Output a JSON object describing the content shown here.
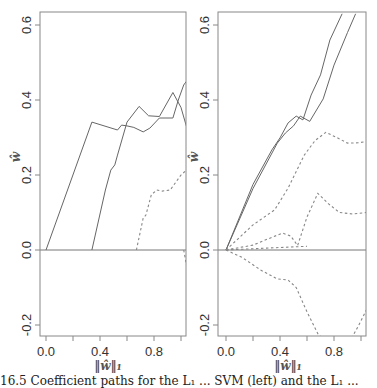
{
  "chart_data": [
    {
      "type": "line",
      "title": "",
      "xlabel": "||ŵ||₁",
      "ylabel": "ŵ",
      "xlim": [
        -0.04,
        1.04
      ],
      "ylim": [
        -0.23,
        0.63
      ],
      "xticks": [
        "0.0",
        "0.4",
        "0.8"
      ],
      "xtick_values": [
        0.0,
        0.2,
        0.4,
        0.6,
        0.8,
        1.0
      ],
      "yticks": [
        "-0.2",
        "0.0",
        "0.2",
        "0.4",
        "0.6"
      ],
      "ytick_values": [
        -0.2,
        0.0,
        0.2,
        0.4,
        0.6
      ],
      "zero_line": true,
      "grid": false,
      "series": [
        {
          "name": "coef-1",
          "style": "solid",
          "points": [
            [
              0.0,
              0.0
            ],
            [
              0.34,
              0.341
            ],
            [
              0.53,
              0.32
            ],
            [
              0.56,
              0.333
            ],
            [
              0.6,
              0.331
            ],
            [
              0.65,
              0.327
            ],
            [
              0.72,
              0.315
            ],
            [
              0.77,
              0.325
            ],
            [
              0.84,
              0.352
            ],
            [
              0.94,
              0.352
            ],
            [
              0.98,
              0.4
            ],
            [
              1.02,
              0.44
            ],
            [
              1.04,
              0.45
            ]
          ]
        },
        {
          "name": "coef-2",
          "style": "solid",
          "points": [
            [
              0.34,
              0.0
            ],
            [
              0.44,
              0.16
            ],
            [
              0.48,
              0.213
            ],
            [
              0.51,
              0.227
            ],
            [
              0.53,
              0.253
            ],
            [
              0.6,
              0.341
            ],
            [
              0.69,
              0.383
            ],
            [
              0.76,
              0.358
            ],
            [
              0.84,
              0.356
            ],
            [
              0.94,
              0.42
            ],
            [
              1.0,
              0.38
            ],
            [
              1.04,
              0.33
            ]
          ]
        },
        {
          "name": "coef-3",
          "style": "dashed",
          "points": [
            [
              0.67,
              0.0
            ],
            [
              0.72,
              0.085
            ],
            [
              0.74,
              0.093
            ],
            [
              0.78,
              0.147
            ],
            [
              0.82,
              0.16
            ],
            [
              0.86,
              0.157
            ],
            [
              0.92,
              0.16
            ],
            [
              0.96,
              0.18
            ],
            [
              1.0,
              0.2
            ],
            [
              1.04,
              0.213
            ]
          ]
        },
        {
          "name": "coef-4",
          "style": "dashed",
          "points": [
            [
              1.02,
              0.0
            ],
            [
              1.03,
              -0.02
            ],
            [
              1.04,
              -0.04
            ]
          ]
        }
      ]
    },
    {
      "type": "line",
      "title": "",
      "xlabel": "||ŵ||₁",
      "ylabel": "ŵ",
      "xlim": [
        -0.06,
        1.04
      ],
      "ylim": [
        -0.23,
        0.63
      ],
      "xticks": [
        "0.0",
        "0.4",
        "0.8"
      ],
      "xtick_values": [
        0.0,
        0.2,
        0.4,
        0.6,
        0.8,
        1.0
      ],
      "yticks": [
        "-0.2",
        "0.0",
        "0.2",
        "0.4",
        "0.6"
      ],
      "ytick_values": [
        -0.2,
        0.0,
        0.2,
        0.4,
        0.6
      ],
      "zero_line": true,
      "grid": false,
      "series": [
        {
          "name": "coef-1",
          "style": "solid",
          "points": [
            [
              0.0,
              0.0
            ],
            [
              0.2,
              0.175
            ],
            [
              0.34,
              0.267
            ],
            [
              0.4,
              0.299
            ],
            [
              0.46,
              0.339
            ],
            [
              0.52,
              0.357
            ],
            [
              0.57,
              0.347
            ],
            [
              0.63,
              0.413
            ],
            [
              0.7,
              0.467
            ],
            [
              0.77,
              0.56
            ],
            [
              0.86,
              0.63
            ]
          ]
        },
        {
          "name": "coef-2",
          "style": "solid",
          "points": [
            [
              0.0,
              0.0
            ],
            [
              0.2,
              0.164
            ],
            [
              0.38,
              0.285
            ],
            [
              0.44,
              0.312
            ],
            [
              0.5,
              0.331
            ],
            [
              0.55,
              0.357
            ],
            [
              0.62,
              0.343
            ],
            [
              0.72,
              0.403
            ],
            [
              0.8,
              0.493
            ],
            [
              0.9,
              0.58
            ],
            [
              0.96,
              0.63
            ]
          ]
        },
        {
          "name": "coef-3",
          "style": "dashed",
          "points": [
            [
              0.0,
              0.0
            ],
            [
              0.2,
              0.067
            ],
            [
              0.36,
              0.107
            ],
            [
              0.46,
              0.165
            ],
            [
              0.58,
              0.253
            ],
            [
              0.66,
              0.292
            ],
            [
              0.74,
              0.314
            ],
            [
              0.82,
              0.3
            ],
            [
              0.9,
              0.285
            ],
            [
              0.98,
              0.286
            ],
            [
              1.04,
              0.289
            ]
          ]
        },
        {
          "name": "coef-4",
          "style": "dashed",
          "points": [
            [
              0.0,
              0.0
            ],
            [
              0.2,
              0.013
            ],
            [
              0.34,
              0.034
            ],
            [
              0.42,
              0.045
            ],
            [
              0.48,
              0.037
            ],
            [
              0.53,
              0.012
            ],
            [
              0.6,
              0.088
            ],
            [
              0.68,
              0.151
            ],
            [
              0.76,
              0.123
            ],
            [
              0.84,
              0.1
            ],
            [
              0.94,
              0.096
            ],
            [
              1.04,
              0.1
            ]
          ]
        },
        {
          "name": "coef-5",
          "style": "dashed",
          "points": [
            [
              0.0,
              0.0
            ],
            [
              0.12,
              -0.02
            ],
            [
              0.26,
              -0.054
            ],
            [
              0.38,
              -0.077
            ],
            [
              0.46,
              -0.08
            ],
            [
              0.52,
              -0.1
            ],
            [
              0.6,
              -0.165
            ],
            [
              0.68,
              -0.223
            ],
            [
              0.71,
              -0.235
            ]
          ]
        },
        {
          "name": "coef-6",
          "style": "dashed",
          "points": [
            [
              0.0,
              0.0
            ],
            [
              0.3,
              0.005
            ],
            [
              0.6,
              0.01
            ]
          ]
        },
        {
          "name": "coef-7",
          "style": "dashed",
          "points": [
            [
              0.93,
              -0.235
            ],
            [
              0.98,
              -0.203
            ],
            [
              1.04,
              -0.16
            ]
          ]
        }
      ]
    }
  ],
  "panels": [
    {
      "ylabel": "ŵ",
      "xlabel": "‖ŵ‖₁",
      "xlabel_sub": "1"
    },
    {
      "ylabel": "ŵ",
      "xlabel": "‖ŵ‖₁",
      "xlabel_sub": "1"
    }
  ],
  "caption": "16.5  Coefficient paths for the L₁ ... SVM (left) and the L₁ ..."
}
